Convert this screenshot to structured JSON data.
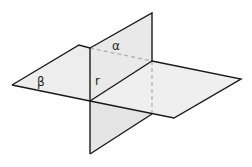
{
  "diagram": {
    "labels": {
      "alpha": "α",
      "beta": "β",
      "line": "r"
    },
    "colors": {
      "plane_fill": "#ececec",
      "plane_fill_front": "#e4e4e4",
      "edge": "#1a1a1a",
      "hidden_edge": "#aaaaaa"
    }
  }
}
